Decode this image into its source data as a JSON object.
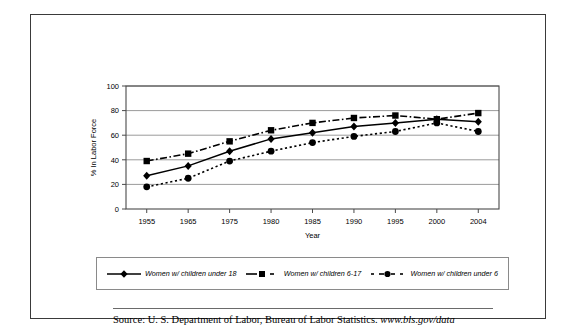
{
  "chart_data": {
    "type": "line",
    "title": "",
    "xlabel": "Year",
    "ylabel": "% In Labor Force",
    "categories": [
      "1955",
      "1965",
      "1975",
      "1980",
      "1985",
      "1990",
      "1995",
      "2000",
      "2004"
    ],
    "ylim": [
      0,
      100
    ],
    "yticks": [
      "0",
      "20",
      "40",
      "60",
      "80",
      "100"
    ],
    "grid": true,
    "legend_position": "bottom",
    "series": [
      {
        "name": "Women w/ children under 18",
        "marker": "diamond",
        "line_style": "solid",
        "values": [
          27,
          35,
          47,
          57,
          62,
          67,
          70,
          73,
          71
        ]
      },
      {
        "name": "Women w/ children 6-17",
        "marker": "square",
        "line_style": "dash-dot",
        "values": [
          39,
          45,
          55,
          64,
          70,
          74,
          76,
          73,
          78
        ]
      },
      {
        "name": "Women w/ children under 6",
        "marker": "circle",
        "line_style": "dotted",
        "values": [
          18,
          25,
          39,
          47,
          54,
          59,
          63,
          70,
          63
        ]
      }
    ]
  },
  "legend": {
    "items": [
      {
        "label": "Women w/ children under 18",
        "marker": "diamond-marker"
      },
      {
        "label": "Women w/ children 6-17",
        "marker": "square-marker"
      },
      {
        "label": "Women w/ children under 6",
        "marker": "circle-marker"
      }
    ]
  },
  "source": {
    "prefix": "Source:  U. S. Department of Labor, Bureau of Labor Statistics.",
    "url": "www.bls.gov/data"
  }
}
